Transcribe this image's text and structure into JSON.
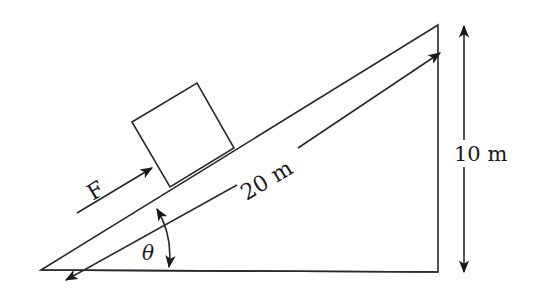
{
  "diagram": {
    "labels": {
      "force": "F",
      "incline_length": "20 m",
      "height": "10 m",
      "angle": "θ"
    },
    "colors": {
      "stroke": "#2a2a2a",
      "text": "#1a1a1a",
      "background": "#ffffff"
    }
  }
}
